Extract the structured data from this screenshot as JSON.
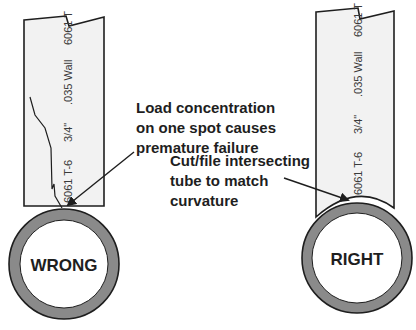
{
  "diagram": {
    "wrong": {
      "tube_label_parts": [
        "6061 T-6",
        "3/4\"",
        ".035 Wall",
        "6061 T"
      ],
      "callout_lines": [
        "Load  concentration",
        "on one spot causes",
        "premature failure"
      ],
      "ring_label": "WRONG"
    },
    "right": {
      "tube_label_parts": [
        "6061 T-6",
        "3/4\"",
        ".035 Wall",
        "6061 T"
      ],
      "callout_lines": [
        "Cut/file intersecting",
        "tube to match",
        "curvature"
      ],
      "ring_label": "RIGHT"
    },
    "colors": {
      "tube_fill": "#f2f2f2",
      "outline": "#1e1e1e",
      "ring_wall": "#8a8a8a",
      "ring_inner": "#ffffff"
    }
  }
}
